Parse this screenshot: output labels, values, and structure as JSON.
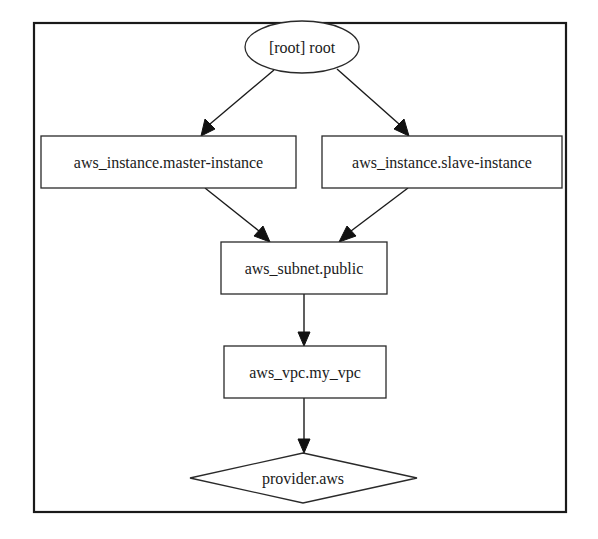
{
  "diagram": {
    "type": "graphviz-dependency-graph",
    "frame": {
      "x": 34,
      "y": 23,
      "width": 532,
      "height": 489
    },
    "nodes": [
      {
        "id": "root",
        "label": "[root] root",
        "shape": "ellipse",
        "cx": 302,
        "cy": 47,
        "rx": 57,
        "ry": 26
      },
      {
        "id": "master",
        "label": "aws_instance.master-instance",
        "shape": "box",
        "x": 41,
        "y": 136,
        "width": 255,
        "height": 52
      },
      {
        "id": "slave",
        "label": "aws_instance.slave-instance",
        "shape": "box",
        "x": 322,
        "y": 136,
        "width": 240,
        "height": 52
      },
      {
        "id": "subnet",
        "label": "aws_subnet.public",
        "shape": "box",
        "x": 221,
        "y": 242,
        "width": 166,
        "height": 52
      },
      {
        "id": "vpc",
        "label": "aws_vpc.my_vpc",
        "shape": "box",
        "x": 224,
        "y": 346,
        "width": 162,
        "height": 52
      },
      {
        "id": "provider",
        "label": "provider.aws",
        "shape": "diamond",
        "cx": 303,
        "cy": 478,
        "hw": 114,
        "hh": 25
      }
    ],
    "edges": [
      {
        "from": "root",
        "to": "master"
      },
      {
        "from": "root",
        "to": "slave"
      },
      {
        "from": "master",
        "to": "subnet"
      },
      {
        "from": "slave",
        "to": "subnet"
      },
      {
        "from": "subnet",
        "to": "vpc"
      },
      {
        "from": "vpc",
        "to": "provider"
      }
    ]
  },
  "labels": {
    "root": "[root] root",
    "master": "aws_instance.master-instance",
    "slave": "aws_instance.slave-instance",
    "subnet": "aws_subnet.public",
    "vpc": "aws_vpc.my_vpc",
    "provider": "provider.aws"
  }
}
